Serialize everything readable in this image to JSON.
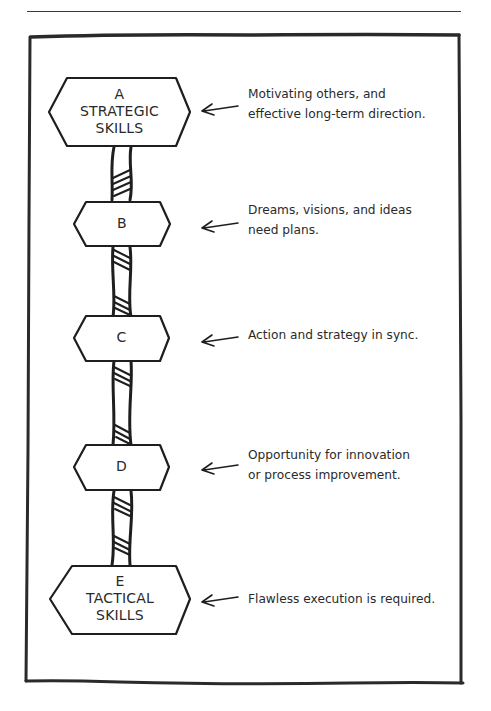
{
  "diagram": {
    "title": "",
    "nodes": [
      {
        "id": "A",
        "letter": "A",
        "line2": "STRATEGIC",
        "line3": "SKILLS",
        "description_lines": [
          "Motivating others, and",
          "effective long-term direction."
        ]
      },
      {
        "id": "B",
        "letter": "B",
        "description_lines": [
          "Dreams, visions, and ideas",
          "need plans."
        ]
      },
      {
        "id": "C",
        "letter": "C",
        "description_lines": [
          "Action and strategy in sync."
        ]
      },
      {
        "id": "D",
        "letter": "D",
        "description_lines": [
          "Opportunity for innovation",
          "or process improvement."
        ]
      },
      {
        "id": "E",
        "letter": "E",
        "line2": "TACTICAL",
        "line3": "SKILLS",
        "description_lines": [
          "Flawless execution is required."
        ]
      }
    ],
    "connector": "twisted-rope",
    "pointer": "left-arrow",
    "colors": {
      "ink": "#2a2a2a",
      "background": "#ffffff"
    }
  }
}
